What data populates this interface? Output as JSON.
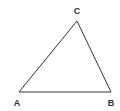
{
  "diagram": {
    "type": "triangle",
    "stroke_color": "#333333",
    "background": "#ffffff",
    "vertices": [
      {
        "id": "A",
        "label": "A",
        "x": 19,
        "y": 92,
        "label_x": 17,
        "label_y": 106
      },
      {
        "id": "B",
        "label": "B",
        "x": 111,
        "y": 92,
        "label_x": 111,
        "label_y": 106
      },
      {
        "id": "C",
        "label": "C",
        "x": 77,
        "y": 21,
        "label_x": 77,
        "label_y": 14
      }
    ],
    "edges": [
      {
        "from": "A",
        "to": "B"
      },
      {
        "from": "B",
        "to": "C"
      },
      {
        "from": "C",
        "to": "A"
      }
    ]
  }
}
